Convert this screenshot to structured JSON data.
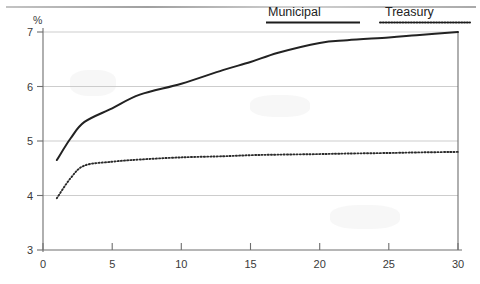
{
  "chart_data": {
    "type": "line",
    "title": "",
    "subtitle": "",
    "xlabel": "",
    "ylabel": "%",
    "yunit": "%",
    "xlim": [
      0,
      30
    ],
    "ylim": [
      3,
      7
    ],
    "grid": true,
    "legend_position": "top-right",
    "x_ticks": [
      "0",
      "5",
      "10",
      "15",
      "20",
      "25",
      "30"
    ],
    "x_tick_values": [
      0,
      5,
      10,
      15,
      20,
      25,
      30
    ],
    "y_ticks": [
      "3",
      "4",
      "5",
      "6",
      "7"
    ],
    "y_tick_values": [
      3,
      4,
      5,
      6,
      7
    ],
    "x": [
      1,
      2,
      3,
      5,
      7,
      10,
      13,
      15,
      17,
      20,
      22,
      25,
      27,
      30
    ],
    "series": [
      {
        "name": "Municipal",
        "style": "solid",
        "color": "#222222",
        "values": [
          4.65,
          5.05,
          5.35,
          5.6,
          5.85,
          6.05,
          6.3,
          6.45,
          6.62,
          6.8,
          6.85,
          6.9,
          6.94,
          7.0
        ]
      },
      {
        "name": "Treasury",
        "style": "dotted",
        "color": "#2b2b2b",
        "values": [
          3.95,
          4.32,
          4.55,
          4.62,
          4.66,
          4.7,
          4.72,
          4.74,
          4.75,
          4.76,
          4.77,
          4.78,
          4.79,
          4.8
        ]
      }
    ]
  },
  "legend": {
    "entries": [
      {
        "label": "Municipal",
        "swatch": "solid-line-swatch"
      },
      {
        "label": "Treasury",
        "swatch": "dotted-line-swatch"
      }
    ]
  },
  "axes": {
    "y_unit_label": "%"
  }
}
